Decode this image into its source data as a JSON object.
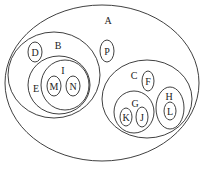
{
  "diagram": {
    "type": "nested-set-diagram",
    "sets": [
      {
        "id": "A",
        "label": "A",
        "parent": null
      },
      {
        "id": "B",
        "label": "B",
        "parent": "A"
      },
      {
        "id": "D",
        "label": "D",
        "parent": "B"
      },
      {
        "id": "E",
        "label": "E",
        "parent": "B"
      },
      {
        "id": "I",
        "label": "I",
        "parent": "E"
      },
      {
        "id": "M",
        "label": "M",
        "parent": "I"
      },
      {
        "id": "N",
        "label": "N",
        "parent": "I"
      },
      {
        "id": "P",
        "label": "P",
        "parent": "A"
      },
      {
        "id": "C",
        "label": "C",
        "parent": "A"
      },
      {
        "id": "F",
        "label": "F",
        "parent": "C"
      },
      {
        "id": "G",
        "label": "G",
        "parent": "C"
      },
      {
        "id": "K",
        "label": "K",
        "parent": "G"
      },
      {
        "id": "J",
        "label": "J",
        "parent": "G"
      },
      {
        "id": "H",
        "label": "H",
        "parent": "C"
      },
      {
        "id": "L",
        "label": "L",
        "parent": "H"
      }
    ]
  }
}
